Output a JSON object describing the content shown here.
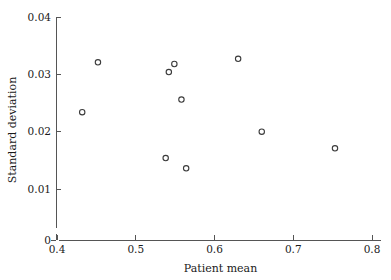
{
  "chart_data": {
    "type": "scatter",
    "title": "",
    "xlabel": "Patient mean",
    "ylabel": "Standard deviation",
    "xlim": [
      0.4,
      0.8
    ],
    "ylim": [
      0.0,
      0.04
    ],
    "y_axis_break": true,
    "grid": false,
    "legend": null,
    "xticks": [
      0.4,
      0.5,
      0.6,
      0.7,
      0.8
    ],
    "xticklabels": [
      "0.4",
      "0.5",
      "0.6",
      "0.7",
      "0.8"
    ],
    "yticks": [
      0,
      0.01,
      0.02,
      0.03,
      0.04
    ],
    "yticklabels": [
      "0",
      "0.01",
      "0.02",
      "0.03",
      "0.04"
    ],
    "marker": "open-circle",
    "marker_color": "#3b3b3b",
    "points": [
      {
        "x": 0.432,
        "y": 0.0234
      },
      {
        "x": 0.452,
        "y": 0.0321
      },
      {
        "x": 0.538,
        "y": 0.0154
      },
      {
        "x": 0.542,
        "y": 0.0304
      },
      {
        "x": 0.549,
        "y": 0.0318
      },
      {
        "x": 0.558,
        "y": 0.0256
      },
      {
        "x": 0.564,
        "y": 0.0136
      },
      {
        "x": 0.63,
        "y": 0.0327
      },
      {
        "x": 0.66,
        "y": 0.02
      },
      {
        "x": 0.753,
        "y": 0.0171
      }
    ]
  }
}
